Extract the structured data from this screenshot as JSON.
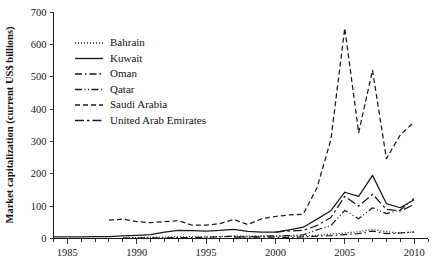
{
  "chart_data": {
    "type": "line",
    "title": "",
    "xlabel": "",
    "ylabel": "Market capitalization (current US$ billions)",
    "xlim": [
      1984,
      2011
    ],
    "ylim": [
      0,
      700
    ],
    "ytick_step": 100,
    "xtick_major_step": 5,
    "xtick_minor_step": 1,
    "grid": false,
    "legend_position": "upper-left-inside",
    "yticks": [
      "0",
      "100",
      "200",
      "300",
      "400",
      "500",
      "600",
      "700"
    ],
    "xticks": [
      "1985",
      "1990",
      "1995",
      "2000",
      "2005",
      "2010"
    ],
    "series": [
      {
        "name": "Bahrain",
        "dash": "1,2",
        "x": [
          1989,
          1990,
          1991,
          1992,
          1993,
          1994,
          1995,
          1996,
          1997,
          1998,
          1999,
          2000,
          2001,
          2002,
          2003,
          2004,
          2005,
          2006,
          2007,
          2008,
          2009,
          2010
        ],
        "values": [
          2,
          3,
          4,
          4,
          5,
          5,
          5,
          6,
          8,
          7,
          7,
          7,
          7,
          8,
          10,
          14,
          17,
          21,
          28,
          21,
          17,
          20
        ]
      },
      {
        "name": "Kuwait",
        "dash": "none",
        "x": [
          1984,
          1985,
          1986,
          1987,
          1988,
          1989,
          1990,
          1991,
          1992,
          1993,
          1994,
          1995,
          1996,
          1997,
          1998,
          1999,
          2000,
          2001,
          2002,
          2003,
          2004,
          2005,
          2006,
          2007,
          2008,
          2009,
          2010
        ],
        "values": [
          5,
          5,
          5,
          6,
          6,
          8,
          10,
          12,
          20,
          25,
          24,
          23,
          25,
          28,
          22,
          20,
          20,
          27,
          35,
          60,
          86,
          143,
          130,
          195,
          108,
          95,
          120
        ]
      },
      {
        "name": "Oman",
        "dash": "7,3,1.5,3",
        "x": [
          1989,
          1990,
          1991,
          1992,
          1993,
          1994,
          1995,
          1996,
          1997,
          1998,
          1999,
          2000,
          2001,
          2002,
          2003,
          2004,
          2005,
          2006,
          2007,
          2008,
          2009,
          2010
        ],
        "values": [
          1,
          1,
          2,
          2,
          3,
          3,
          4,
          5,
          7,
          4,
          4,
          4,
          3,
          5,
          7,
          9,
          12,
          15,
          23,
          15,
          17,
          20
        ]
      },
      {
        "name": "Qatar",
        "dash": "7,2.5,1,2.5,1,2.5",
        "x": [
          1997,
          1998,
          1999,
          2000,
          2001,
          2002,
          2003,
          2004,
          2005,
          2006,
          2007,
          2008,
          2009,
          2010
        ],
        "values": [
          4,
          5,
          7,
          8,
          9,
          11,
          27,
          40,
          87,
          61,
          95,
          77,
          88,
          124
        ]
      },
      {
        "name": "Saudi Arabia",
        "dash": "5,3",
        "x": [
          1988,
          1989,
          1990,
          1991,
          1992,
          1993,
          1994,
          1995,
          1996,
          1997,
          1998,
          1999,
          2000,
          2001,
          2002,
          2003,
          2004,
          2005,
          2006,
          2007,
          2008,
          2009,
          2010
        ],
        "values": [
          57,
          60,
          52,
          49,
          52,
          55,
          41,
          41,
          46,
          59,
          43,
          61,
          68,
          73,
          75,
          157,
          306,
          650,
          327,
          520,
          247,
          320,
          360
        ]
      },
      {
        "name": "United Arab Emirates",
        "dash": "9,3,2.5,3",
        "x": [
          2000,
          2001,
          2002,
          2003,
          2004,
          2005,
          2006,
          2007,
          2008,
          2009,
          2010
        ],
        "values": [
          20,
          23,
          25,
          40,
          65,
          130,
          100,
          137,
          90,
          85,
          105
        ]
      }
    ]
  },
  "legend": {
    "items": [
      {
        "label": "Bahrain"
      },
      {
        "label": "Kuwait"
      },
      {
        "label": "Oman"
      },
      {
        "label": "Qatar"
      },
      {
        "label": "Saudi Arabia"
      },
      {
        "label": "United Arab Emirates"
      }
    ]
  }
}
